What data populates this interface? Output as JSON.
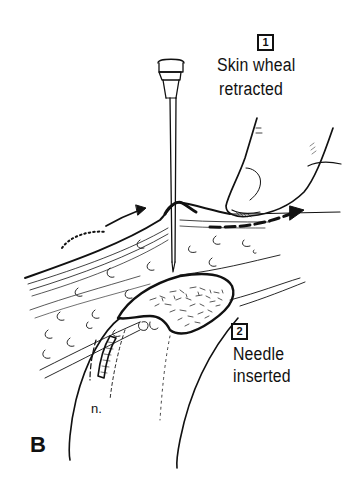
{
  "figure": {
    "panel_letter": "B",
    "steps": [
      {
        "number": "1",
        "line1": "Skin wheal",
        "line2": "retracted"
      },
      {
        "number": "2",
        "line1": "Needle",
        "line2": "inserted"
      }
    ],
    "nerve_label": "n.",
    "colors": {
      "ink": "#111111",
      "background": "#ffffff"
    }
  }
}
